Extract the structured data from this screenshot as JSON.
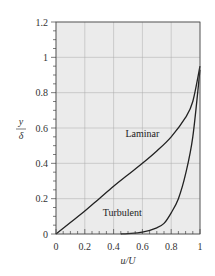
{
  "chart_data": {
    "type": "line",
    "title": "",
    "xlabel": "u/U",
    "ylabel_num": "y",
    "ylabel_den": "δ",
    "xlim": [
      0,
      1
    ],
    "ylim": [
      0,
      1.2
    ],
    "grid": true,
    "legend": "inline labels",
    "x_ticks": [
      0,
      0.2,
      0.4,
      0.6,
      0.8,
      1
    ],
    "x_tick_labels": [
      "0",
      "0.2",
      "0.4",
      "0.6",
      "0.8",
      "1"
    ],
    "y_ticks": [
      0,
      0.2,
      0.4,
      0.6,
      0.8,
      1,
      1.2
    ],
    "y_tick_labels": [
      "0",
      "0.2",
      "0.4",
      "0.6",
      "0.8",
      "1",
      "1.2"
    ],
    "series": [
      {
        "name": "Laminar",
        "label_pos": {
          "x": 0.6,
          "y": 0.55
        },
        "x": [
          0,
          0.1,
          0.2,
          0.3,
          0.4,
          0.5,
          0.6,
          0.7,
          0.8,
          0.9,
          0.95,
          1.0
        ],
        "y": [
          0,
          0.065,
          0.13,
          0.2,
          0.27,
          0.335,
          0.4,
          0.47,
          0.55,
          0.66,
          0.75,
          0.95
        ]
      },
      {
        "name": "Turbulent",
        "label_pos": {
          "x": 0.46,
          "y": 0.1
        },
        "x": [
          0.45,
          0.5,
          0.6,
          0.7,
          0.75,
          0.8,
          0.85,
          0.9,
          0.95,
          1.0
        ],
        "y": [
          0.0,
          0.002,
          0.01,
          0.035,
          0.06,
          0.12,
          0.2,
          0.34,
          0.55,
          0.93
        ]
      }
    ]
  },
  "colors": {
    "plot_bg": "#ebebeb",
    "grid": "#aaaaaa",
    "curve": "#222222",
    "axis": "#444444"
  }
}
